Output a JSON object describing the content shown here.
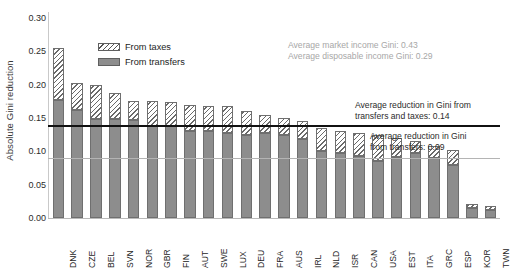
{
  "chart_data": {
    "type": "bar",
    "title": "",
    "xlabel": "",
    "ylabel": "Absolute Gini reduction",
    "ylim": [
      0.0,
      0.3
    ],
    "yticks": [
      "0.00",
      "0.05",
      "0.10",
      "0.15",
      "0.20",
      "0.25",
      "0.30"
    ],
    "ytick_values": [
      0.0,
      0.05,
      0.1,
      0.15,
      0.2,
      0.25,
      0.3
    ],
    "grid": false,
    "stacked": true,
    "legend_position": "upper-left-inside",
    "categories": [
      "DNK",
      "CZE",
      "BEL",
      "SVN",
      "NOR",
      "GBR",
      "FIN",
      "AUT",
      "SWE",
      "LUX",
      "DEU",
      "FRA",
      "AUS",
      "IRL",
      "NLD",
      "ISR",
      "CAN",
      "USA",
      "EST",
      "ITA",
      "GRC",
      "ESP",
      "KOR",
      "TWN"
    ],
    "series": [
      {
        "name": "From transfers",
        "color": "#8d8d8d",
        "pattern": "solid",
        "values": [
          0.177,
          0.162,
          0.148,
          0.148,
          0.147,
          0.138,
          0.138,
          0.13,
          0.13,
          0.127,
          0.125,
          0.127,
          0.125,
          0.118,
          0.1,
          0.098,
          0.093,
          0.085,
          0.092,
          0.098,
          0.09,
          0.08,
          0.015,
          0.012
        ]
      },
      {
        "name": "From taxes",
        "color": "#ffffff",
        "pattern": "diagonal-hatch",
        "values": [
          0.078,
          0.041,
          0.052,
          0.04,
          0.029,
          0.038,
          0.036,
          0.04,
          0.038,
          0.041,
          0.035,
          0.028,
          0.025,
          0.027,
          0.035,
          0.033,
          0.035,
          0.04,
          0.028,
          0.018,
          0.018,
          0.022,
          0.006,
          0.006
        ]
      }
    ],
    "totals": [
      0.255,
      0.203,
      0.2,
      0.188,
      0.176,
      0.176,
      0.174,
      0.17,
      0.168,
      0.168,
      0.16,
      0.155,
      0.15,
      0.145,
      0.135,
      0.131,
      0.128,
      0.125,
      0.12,
      0.116,
      0.108,
      0.102,
      0.021,
      0.018
    ],
    "reference_lines": [
      {
        "name": "Average reduction in Gini from transfers and taxes",
        "value": 0.14,
        "label": "Average reduction in Gini from\ntransfers and taxes:  0.14",
        "color": "#111111",
        "style": "solid-thick"
      },
      {
        "name": "Average reduction in Gini from transfers",
        "value": 0.09,
        "label": "Average reduction in Gini\nfrom transfers: 0.09",
        "color": "#b4b4b4",
        "style": "solid-light"
      }
    ],
    "annotations": [
      {
        "name": "average-gini-note",
        "text": "Average market income Gini: 0.43\nAverage disposable income Gini: 0.29",
        "color": "#a7a7a7"
      }
    ]
  },
  "legend": {
    "items": [
      {
        "label": "From taxes",
        "swatch": "diagonal-hatch-swatch"
      },
      {
        "label": "From transfers",
        "swatch": "solid-gray-swatch"
      }
    ]
  }
}
